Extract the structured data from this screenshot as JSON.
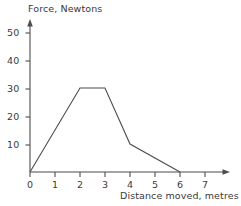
{
  "chart_data": {
    "type": "line",
    "title": "",
    "xlabel": "Distance moved, metres",
    "ylabel": "Force, Newtons",
    "xlim": [
      0,
      7
    ],
    "ylim": [
      0,
      55
    ],
    "grid": false,
    "legend": null,
    "x_ticks": [
      "0",
      "1",
      "2",
      "3",
      "4",
      "5",
      "6",
      "7"
    ],
    "x_tick_values": [
      0,
      1,
      2,
      3,
      4,
      5,
      6,
      7
    ],
    "y_ticks": [
      "10",
      "20",
      "30",
      "40",
      "50"
    ],
    "y_tick_values": [
      10,
      20,
      30,
      40,
      50
    ],
    "series": [
      {
        "name": "Force",
        "x": [
          0,
          2,
          3,
          4,
          6
        ],
        "values": [
          0,
          30,
          30,
          10,
          0
        ],
        "color": "#4d4d4d"
      }
    ],
    "axis_style": {
      "arrows": true,
      "spines": [
        "left",
        "bottom"
      ],
      "line_color": "#4d4d4d"
    }
  },
  "axis_labels": {
    "y": "Force, Newtons",
    "x": "Distance moved, metres"
  }
}
